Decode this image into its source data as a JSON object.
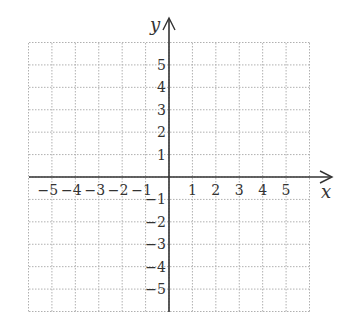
{
  "chart_data": {
    "type": "coordinate-grid",
    "title": "",
    "xlabel": "x",
    "ylabel": "y",
    "xlim": [
      -6,
      6
    ],
    "ylim": [
      -6,
      6
    ],
    "grid": true,
    "grid_style": "dotted",
    "x_ticks": [
      -5,
      -4,
      -3,
      -2,
      -1,
      1,
      2,
      3,
      4,
      5
    ],
    "y_ticks": [
      5,
      4,
      3,
      2,
      1,
      -1,
      -2,
      -3,
      -4,
      -5
    ],
    "x_tick_labels": [
      "−5",
      "−4",
      "−3",
      "−2",
      "−1",
      "1",
      "2",
      "3",
      "4",
      "5"
    ],
    "y_tick_labels": [
      "5",
      "4",
      "3",
      "2",
      "1",
      "−1",
      "−2",
      "−3",
      "−4",
      "−5"
    ]
  },
  "colors": {
    "axis": "#333333",
    "grid": "#b0b0b0",
    "text": "#333333"
  }
}
